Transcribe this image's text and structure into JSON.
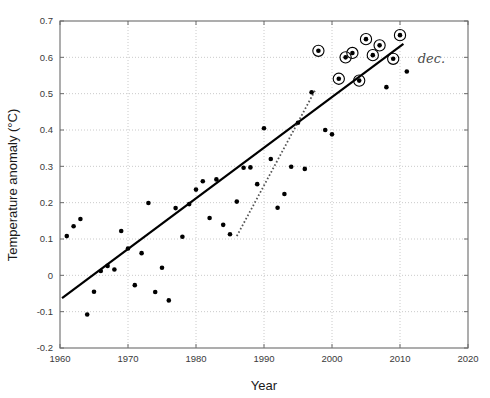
{
  "chart_data": {
    "type": "scatter",
    "title": "",
    "xlabel": "Year",
    "ylabel": "Temperature anomaly (°C)",
    "xlim": [
      1960,
      2020
    ],
    "ylim": [
      -0.2,
      0.7
    ],
    "xticks": [
      1960,
      1970,
      1980,
      1990,
      2000,
      2010,
      2020
    ],
    "xtick_labels": [
      "1960",
      "1970",
      "1980",
      "1990",
      "2000",
      "2010",
      "2020"
    ],
    "yticks": [
      -0.2,
      -0.1,
      0,
      0.1,
      0.2,
      0.3,
      0.4,
      0.5,
      0.6,
      0.7
    ],
    "ytick_labels": [
      "-0.2",
      "-0.1",
      "0",
      "0.1",
      "0.2",
      "0.3",
      "0.4",
      "0.5",
      "0.6",
      "0.7"
    ],
    "grid": true,
    "grid_style": "dotted",
    "legend": "none",
    "series": [
      {
        "name": "Annual temperature anomaly",
        "marker": "filled-circle",
        "color": "#000000",
        "points": [
          [
            1961,
            0.108
          ],
          [
            1962,
            0.135
          ],
          [
            1963,
            0.155
          ],
          [
            1964,
            -0.108
          ],
          [
            1965,
            -0.045
          ],
          [
            1966,
            0.012
          ],
          [
            1967,
            0.026
          ],
          [
            1968,
            0.016
          ],
          [
            1969,
            0.122
          ],
          [
            1970,
            0.074
          ],
          [
            1971,
            -0.027
          ],
          [
            1972,
            0.061
          ],
          [
            1973,
            0.199
          ],
          [
            1974,
            -0.046
          ],
          [
            1975,
            0.021
          ],
          [
            1976,
            -0.069
          ],
          [
            1977,
            0.185
          ],
          [
            1978,
            0.106
          ],
          [
            1979,
            0.196
          ],
          [
            1980,
            0.236
          ],
          [
            1981,
            0.259
          ],
          [
            1982,
            0.158
          ],
          [
            1983,
            0.264
          ],
          [
            1984,
            0.139
          ],
          [
            1985,
            0.113
          ],
          [
            1986,
            0.203
          ],
          [
            1987,
            0.296
          ],
          [
            1988,
            0.297
          ],
          [
            1989,
            0.251
          ],
          [
            1990,
            0.405
          ],
          [
            1991,
            0.32
          ],
          [
            1992,
            0.186
          ],
          [
            1993,
            0.224
          ],
          [
            1994,
            0.299
          ],
          [
            1995,
            0.42
          ],
          [
            1996,
            0.293
          ],
          [
            1997,
            0.504
          ],
          [
            1998,
            0.618
          ],
          [
            1999,
            0.4
          ],
          [
            2000,
            0.388
          ],
          [
            2001,
            0.541
          ],
          [
            2002,
            0.6
          ],
          [
            2003,
            0.612
          ],
          [
            2004,
            0.536
          ],
          [
            2005,
            0.65
          ],
          [
            2006,
            0.606
          ],
          [
            2007,
            0.633
          ],
          [
            2008,
            0.518
          ],
          [
            2009,
            0.596
          ],
          [
            2010,
            0.661
          ],
          [
            2011,
            0.561
          ]
        ]
      },
      {
        "name": "Record warm years (circled)",
        "marker": "circled-dot",
        "color": "#000000",
        "points": [
          [
            1998,
            0.618
          ],
          [
            2001,
            0.541
          ],
          [
            2002,
            0.6
          ],
          [
            2003,
            0.612
          ],
          [
            2004,
            0.536
          ],
          [
            2005,
            0.65
          ],
          [
            2006,
            0.606
          ],
          [
            2007,
            0.633
          ],
          [
            2009,
            0.596
          ],
          [
            2010,
            0.661
          ]
        ]
      }
    ],
    "lines": [
      {
        "name": "long-term linear trend",
        "style": "solid",
        "width": 2.2,
        "color": "#000000",
        "from": [
          1960.3,
          -0.063
        ],
        "to": [
          2010.5,
          0.637
        ]
      },
      {
        "name": "short-term trend",
        "style": "dotted",
        "width": 1.8,
        "color": "#555555",
        "from": [
          1986.0,
          0.108
        ],
        "to": [
          1997.6,
          0.512
        ]
      }
    ],
    "annotations": [
      {
        "name": "handwritten-note",
        "text": "dec.",
        "x": 2012.6,
        "y": 0.585,
        "style": "handwritten"
      }
    ]
  },
  "axes": {
    "x_label": "Year",
    "y_label": "Temperature anomaly (°C)"
  },
  "colors": {
    "axis": "#6b6b6b",
    "grid": "#bdbdbd",
    "marker": "#000000",
    "trend": "#000000",
    "background": "#ffffff"
  }
}
